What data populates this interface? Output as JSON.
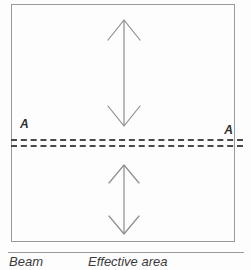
{
  "figure": {
    "type": "engineering-section-diagram"
  },
  "beam": {
    "name": "beam-outline"
  },
  "section_line": {
    "style": "double-dashed",
    "label_left": "A",
    "label_right": "A"
  },
  "arrows": {
    "upper": {
      "name": "effective-area-extent-upper",
      "style": "double-headed",
      "orientation": "vertical"
    },
    "lower": {
      "name": "effective-area-extent-lower",
      "style": "double-headed",
      "orientation": "vertical"
    }
  },
  "caption": {
    "beam_label": "Beam",
    "effective_area_label": "Effective area"
  },
  "colors": {
    "line": "#9a9a9a",
    "dash": "#4a4a4a",
    "text": "#3a3a3a",
    "background": "#fdfdfd"
  }
}
